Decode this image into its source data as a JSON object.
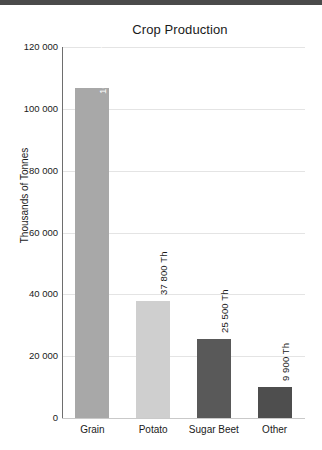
{
  "chart_data": {
    "type": "bar",
    "title": "Crop Production",
    "xlabel": "",
    "ylabel": "Thousands of Tonnes",
    "categories": [
      "Grain",
      "Potato",
      "Sugar Beet",
      "Other"
    ],
    "values": [
      106800,
      37800,
      25500,
      9900
    ],
    "data_labels": [
      "106 800 Th",
      "37 800 Th",
      "25 500 Th",
      "9 900 Th"
    ],
    "bar_colors": [
      "#a8a8a8",
      "#cfcfcf",
      "#595959",
      "#4e4e4e"
    ],
    "label_placement": [
      "inside",
      "outside",
      "outside",
      "outside"
    ],
    "ylim": [
      0,
      120000
    ],
    "y_ticks": [
      0,
      20000,
      40000,
      60000,
      80000,
      100000,
      120000
    ],
    "y_tick_labels": [
      "0",
      "20 000",
      "40 000",
      "60 000",
      "80 000",
      "100 000",
      "120 000"
    ],
    "grid": true,
    "legend": false,
    "axis_color": "#6e6e6e",
    "grid_color": "#e4e4e4",
    "background": "#ffffff"
  }
}
